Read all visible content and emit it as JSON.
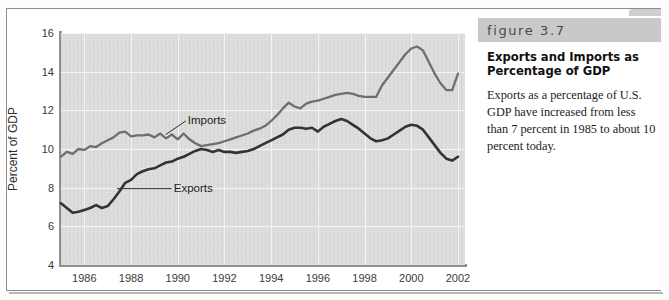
{
  "figure": {
    "banner_label": "figure 3.7",
    "title": "Exports and Imports as Percentage of GDP",
    "body": "Exports as a percentage of U.S. GDP have increased from less than 7 percent in 1985 to about 10 percent today."
  },
  "colors": {
    "plot_background": "#dcdcdc",
    "gridline": "#f4f4f4",
    "axis": "#8f8f8f",
    "imports_line": "#6e6e6e",
    "exports_line": "#333333",
    "banner_background": "#c9c9c9",
    "frame_border": "#8d8d8d"
  },
  "chart_data": {
    "type": "line",
    "title": "Exports and Imports as Percentage of GDP",
    "xlabel": "",
    "ylabel": "Percent of GDP",
    "xlim": [
      1985.0,
      2002.3
    ],
    "ylim": [
      4,
      16
    ],
    "yticks": [
      4,
      6,
      8,
      10,
      12,
      14,
      16
    ],
    "xticks": [
      1986,
      1988,
      1990,
      1992,
      1994,
      1996,
      1998,
      2000,
      2002
    ],
    "grid": true,
    "legend_position": "inline-annotations",
    "annotations": [
      {
        "text": "Imports",
        "x": 1990.0,
        "y": 11.45
      },
      {
        "text": "Exports",
        "x": 1989.4,
        "y": 7.95
      }
    ],
    "series": [
      {
        "name": "Imports",
        "color": "#6e6e6e",
        "x": [
          1985.0,
          1985.25,
          1985.5,
          1985.75,
          1986.0,
          1986.25,
          1986.5,
          1986.75,
          1987.0,
          1987.25,
          1987.5,
          1987.75,
          1988.0,
          1988.25,
          1988.5,
          1988.75,
          1989.0,
          1989.25,
          1989.5,
          1989.75,
          1990.0,
          1990.25,
          1990.5,
          1990.75,
          1991.0,
          1991.25,
          1991.5,
          1991.75,
          1992.0,
          1992.25,
          1992.5,
          1992.75,
          1993.0,
          1993.25,
          1993.5,
          1993.75,
          1994.0,
          1994.25,
          1994.5,
          1994.75,
          1995.0,
          1995.25,
          1995.5,
          1995.75,
          1996.0,
          1996.25,
          1996.5,
          1996.75,
          1997.0,
          1997.25,
          1997.5,
          1997.75,
          1998.0,
          1998.25,
          1998.5,
          1998.75,
          1999.0,
          1999.25,
          1999.5,
          1999.75,
          2000.0,
          2000.25,
          2000.5,
          2000.75,
          2001.0,
          2001.25,
          2001.5,
          2001.75,
          2002.0
        ],
        "y": [
          9.6,
          9.85,
          9.75,
          10.0,
          9.95,
          10.15,
          10.1,
          10.3,
          10.45,
          10.6,
          10.85,
          10.9,
          10.65,
          10.7,
          10.7,
          10.75,
          10.6,
          10.8,
          10.55,
          10.75,
          10.5,
          10.8,
          10.5,
          10.3,
          10.15,
          10.2,
          10.25,
          10.3,
          10.4,
          10.5,
          10.6,
          10.7,
          10.8,
          10.95,
          11.05,
          11.2,
          11.45,
          11.75,
          12.1,
          12.4,
          12.2,
          12.1,
          12.35,
          12.45,
          12.5,
          12.6,
          12.7,
          12.8,
          12.85,
          12.9,
          12.85,
          12.75,
          12.7,
          12.7,
          12.7,
          13.3,
          13.7,
          14.1,
          14.5,
          14.9,
          15.2,
          15.3,
          15.1,
          14.5,
          13.9,
          13.4,
          13.05,
          13.05,
          13.9
        ]
      },
      {
        "name": "Exports",
        "color": "#333333",
        "x": [
          1985.0,
          1985.25,
          1985.5,
          1985.75,
          1986.0,
          1986.25,
          1986.5,
          1986.75,
          1987.0,
          1987.25,
          1987.5,
          1987.75,
          1988.0,
          1988.25,
          1988.5,
          1988.75,
          1989.0,
          1989.25,
          1989.5,
          1989.75,
          1990.0,
          1990.25,
          1990.5,
          1990.75,
          1991.0,
          1991.25,
          1991.5,
          1991.75,
          1992.0,
          1992.25,
          1992.5,
          1992.75,
          1993.0,
          1993.25,
          1993.5,
          1993.75,
          1994.0,
          1994.25,
          1994.5,
          1994.75,
          1995.0,
          1995.25,
          1995.5,
          1995.75,
          1996.0,
          1996.25,
          1996.5,
          1996.75,
          1997.0,
          1997.25,
          1997.5,
          1997.75,
          1998.0,
          1998.25,
          1998.5,
          1998.75,
          1999.0,
          1999.25,
          1999.5,
          1999.75,
          2000.0,
          2000.25,
          2000.5,
          2000.75,
          2001.0,
          2001.25,
          2001.5,
          2001.75,
          2002.0
        ],
        "y": [
          7.2,
          6.95,
          6.7,
          6.75,
          6.85,
          6.95,
          7.1,
          6.95,
          7.05,
          7.4,
          7.8,
          8.25,
          8.4,
          8.7,
          8.85,
          8.95,
          9.0,
          9.15,
          9.3,
          9.35,
          9.5,
          9.6,
          9.75,
          9.9,
          10.0,
          9.95,
          9.85,
          9.95,
          9.85,
          9.85,
          9.8,
          9.85,
          9.9,
          10.0,
          10.15,
          10.3,
          10.45,
          10.6,
          10.75,
          11.0,
          11.1,
          11.1,
          11.05,
          11.1,
          10.9,
          11.15,
          11.3,
          11.45,
          11.55,
          11.45,
          11.25,
          11.05,
          10.8,
          10.55,
          10.4,
          10.45,
          10.55,
          10.75,
          10.95,
          11.15,
          11.25,
          11.2,
          11.0,
          10.6,
          10.2,
          9.8,
          9.5,
          9.4,
          9.6
        ]
      }
    ]
  }
}
